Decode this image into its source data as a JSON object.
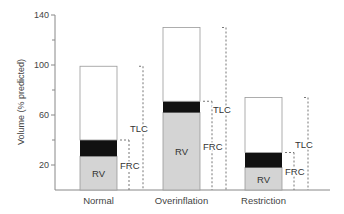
{
  "chart_data": {
    "type": "bar",
    "subtype": "stacked-bar-with-dashed-brackets",
    "title": "",
    "xlabel": "",
    "ylabel": "Volume (% predicted)",
    "ylim": [
      0,
      140
    ],
    "yticks_major": [
      20,
      60,
      100,
      140
    ],
    "yticks_minor": [
      40,
      80,
      120
    ],
    "grid": false,
    "legend": null,
    "categories": [
      "Normal",
      "Overinflation",
      "Restriction"
    ],
    "segments_legend": {
      "RV": "Residual volume (light gray, bottom segment)",
      "ERV": "Expiratory reserve volume (black band)",
      "IC": "Remaining capacity up to TLC (white top segment)"
    },
    "series": [
      {
        "name": "RV",
        "values": [
          27,
          62,
          18
        ],
        "color": "#d4d4d4"
      },
      {
        "name": "ERV (black band)",
        "values": [
          13,
          9,
          12
        ],
        "color": "#111111"
      },
      {
        "name": "Inspiratory capacity (white)",
        "values": [
          59,
          59,
          44
        ],
        "color": "#ffffff"
      }
    ],
    "totals_TLC": [
      99,
      130,
      74
    ],
    "FRC": [
      40,
      71,
      30
    ],
    "annotations": [
      {
        "category": "Normal",
        "bar_label": "RV",
        "brackets": [
          "FRC",
          "TLC"
        ]
      },
      {
        "category": "Overinflation",
        "bar_label": "RV",
        "brackets": [
          "FRC",
          "TLC"
        ]
      },
      {
        "category": "Restriction",
        "bar_label": "RV",
        "brackets": [
          "FRC",
          "TLC"
        ]
      }
    ],
    "colors": {
      "rv": "#d4d4d4",
      "band": "#111111",
      "top": "#ffffff",
      "axis": "#888888",
      "dash": "#777777"
    }
  },
  "labels": {
    "rv": "RV",
    "frc": "FRC",
    "tlc": "TLC"
  }
}
